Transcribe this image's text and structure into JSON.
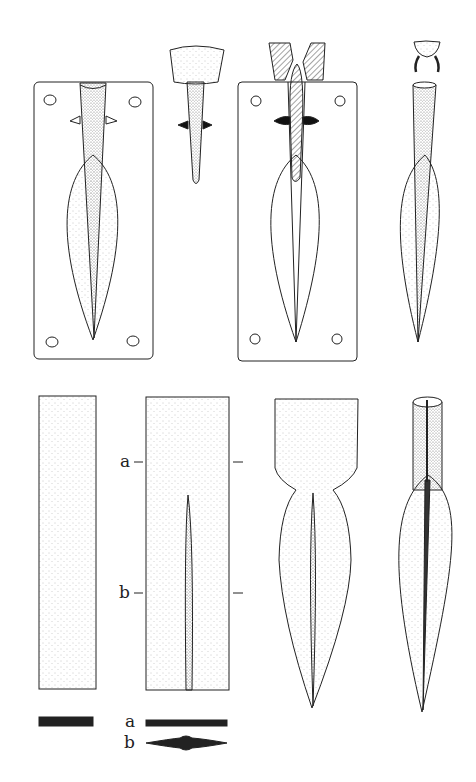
{
  "figure": {
    "type": "archaeological illustration",
    "panels": [
      {
        "id": "mould-open-left",
        "desc": "Open mould half with spearhead cavity and core peg"
      },
      {
        "id": "core-plug",
        "desc": "Clay core with plug and chaplet pin"
      },
      {
        "id": "mould-section",
        "desc": "Mould in section with hatched core and pour channels"
      },
      {
        "id": "cast-spearhead",
        "desc": "Cast spearhead with core cap removed"
      },
      {
        "id": "blank-bar",
        "desc": "Flat bar blank"
      },
      {
        "id": "blank-marked",
        "desc": "Blank with midrib and section marks a, b"
      },
      {
        "id": "forged-shape",
        "desc": "Forged blade shape with flat tang"
      },
      {
        "id": "finished-spearhead",
        "desc": "Finished socketed spearhead"
      }
    ]
  },
  "labels": {
    "section_a": "a",
    "section_b": "b",
    "section_a_bottom": "a",
    "section_b_bottom": "b"
  },
  "colors": {
    "ink": "#222222",
    "paper": "#ffffff",
    "stipple": "#777777"
  }
}
